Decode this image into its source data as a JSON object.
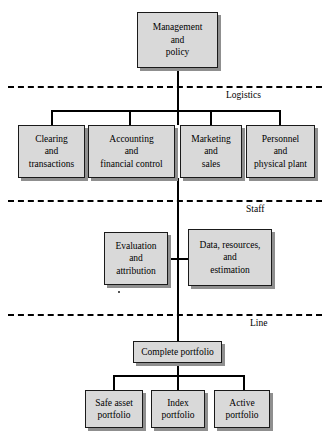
{
  "diagram": {
    "colors": {
      "box_fill": "#d9d9d9",
      "box_border": "#1a1a1a",
      "box_shadow": "#8f8f8f",
      "line": "#000000",
      "background": "#ffffff"
    },
    "zone_labels": {
      "logistics": "Logistics",
      "staff": "Staff",
      "line": "Line"
    },
    "nodes": {
      "root": "Management and policy",
      "logistics": [
        "Clearing and transactions",
        "Accounting and financial control",
        "Marketing and sales",
        "Personnel and physical plant"
      ],
      "staff": [
        "Evaluation and attribution",
        "Data, resources, and estimation"
      ],
      "line_root": "Complete portfolio",
      "line_children": [
        "Safe asset portfolio",
        "Index portfolio",
        "Active portfolio"
      ]
    },
    "node_lines": {
      "root": [
        "Management",
        "and",
        "policy"
      ],
      "clearing": [
        "Clearing",
        "and",
        "transactions"
      ],
      "accounting": [
        "Accounting",
        "and",
        "financial control"
      ],
      "marketing": [
        "Marketing",
        "and",
        "sales"
      ],
      "personnel": [
        "Personnel",
        "and",
        "physical plant"
      ],
      "evaluation": [
        "Evaluation",
        "and",
        "attribution"
      ],
      "data": [
        "Data, resources,",
        "and",
        "estimation"
      ],
      "complete": [
        "Complete portfolio"
      ],
      "safe": [
        "Safe asset",
        "portfolio"
      ],
      "index": [
        "Index",
        "portfolio"
      ],
      "active": [
        "Active",
        "portfolio"
      ]
    }
  }
}
